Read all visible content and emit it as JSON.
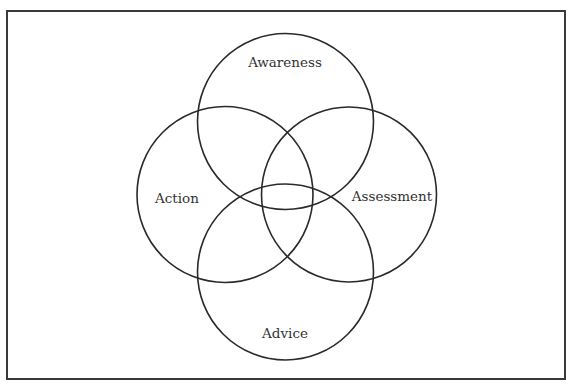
{
  "diagram": {
    "type": "venn-four-circle",
    "colors": {
      "background": "#ffffff",
      "frame_stroke": "#3a3a3a",
      "circle_stroke": "#2a2a2a",
      "text": "#333333"
    },
    "frame": {
      "x": 7,
      "y": 11,
      "width": 558,
      "height": 368
    },
    "circles": [
      {
        "id": "awareness",
        "label": "Awareness",
        "position": "top",
        "cx": 285.5,
        "cy": 121.5,
        "r": 88,
        "label_x": 285,
        "label_y": 67
      },
      {
        "id": "action",
        "label": "Action",
        "position": "left",
        "cx": 225,
        "cy": 194.5,
        "r": 88,
        "label_x": 177,
        "label_y": 203
      },
      {
        "id": "assessment",
        "label": "Assessment",
        "position": "right",
        "cx": 349,
        "cy": 194.5,
        "r": 87.5,
        "label_x": 392,
        "label_y": 201
      },
      {
        "id": "advice",
        "label": "Advice",
        "position": "bottom",
        "cx": 285.5,
        "cy": 272,
        "r": 88,
        "label_x": 285,
        "label_y": 338
      }
    ]
  }
}
